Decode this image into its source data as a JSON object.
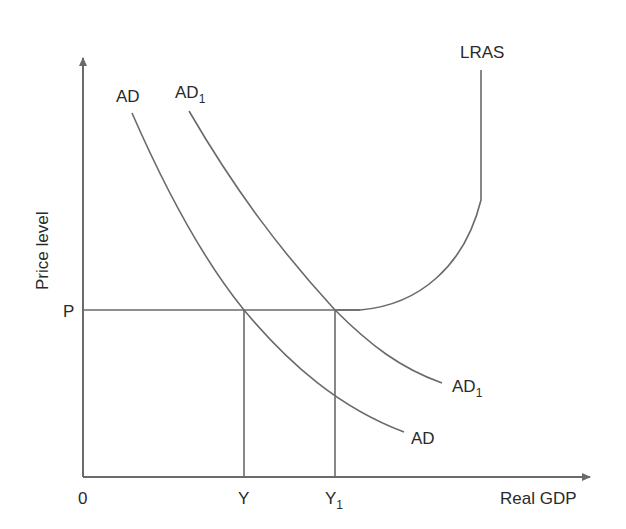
{
  "diagram": {
    "type": "AD-LRAS economics diagram",
    "axes": {
      "x_label": "Real GDP",
      "y_label": "Price level",
      "origin_label": "0"
    },
    "price_level": {
      "label": "P"
    },
    "output_levels": [
      {
        "label": "Y",
        "sub": ""
      },
      {
        "label": "Y",
        "sub": "1"
      }
    ],
    "curves": {
      "ad": {
        "label": "AD",
        "sub": ""
      },
      "ad1": {
        "label": "AD",
        "sub": "1"
      },
      "lras": {
        "label": "LRAS"
      }
    },
    "colors": {
      "line": "#6a6a6a",
      "text": "#2a2a2a",
      "background": "#ffffff"
    }
  }
}
